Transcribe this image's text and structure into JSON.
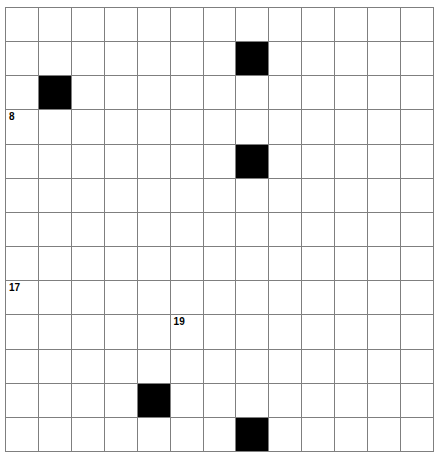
{
  "puzzle": {
    "type": "crossword-grid",
    "rows": 13,
    "cols": 13,
    "colors": {
      "background": "#ffffff",
      "grid_line": "#7f7f7f",
      "block": "#000000",
      "number_text": "#000000"
    },
    "block_cells": [
      {
        "row": 1,
        "col": 7
      },
      {
        "row": 2,
        "col": 1
      },
      {
        "row": 4,
        "col": 7
      },
      {
        "row": 11,
        "col": 4
      },
      {
        "row": 12,
        "col": 7
      }
    ],
    "numbers": [
      {
        "row": 3,
        "col": 0,
        "label": "8"
      },
      {
        "row": 8,
        "col": 0,
        "label": "17"
      },
      {
        "row": 9,
        "col": 5,
        "label": "19"
      }
    ]
  }
}
